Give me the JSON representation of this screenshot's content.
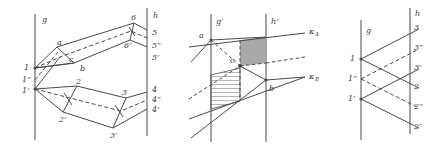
{
  "figure": {
    "kind": "geometric-line-diagram",
    "background_color": "#ffffff",
    "stroke_color": "#4a4a4a",
    "label_color": "#3a3a3a",
    "shade_fill": "#a8a8a8",
    "panel_count": 3
  },
  "panels": [
    {
      "id": "panel-left",
      "name": "left-panel",
      "axis_labels": {
        "left_line": "g",
        "right_line": "h"
      },
      "left_labels": [
        "1",
        "1”",
        "1’"
      ],
      "right_labels": [
        "5",
        "5”",
        "5’",
        "4",
        "4”",
        "4’"
      ],
      "interior_labels": [
        "a",
        "c",
        "b",
        "6",
        "6’",
        "2",
        "2’",
        "3",
        "3’"
      ]
    },
    {
      "id": "panel-middle",
      "name": "middle-panel",
      "axis_labels": {
        "left_line": "g’",
        "right_line": "h’"
      },
      "point_labels": [
        "a",
        "c",
        "b"
      ],
      "ray_labels": [
        "κ",
        "κ"
      ],
      "ray_sublabels": [
        "A",
        "B"
      ],
      "regions": [
        {
          "name": "shaded-quad",
          "style": "solid-gray"
        },
        {
          "name": "hatched-quad",
          "style": "diagonal-hatch"
        }
      ]
    },
    {
      "id": "panel-right",
      "name": "right-panel",
      "axis_labels": {
        "left_line": "g",
        "right_line": "h"
      },
      "left_labels": [
        "1",
        "1”",
        "1’"
      ],
      "right_labels": [
        "3",
        "3”",
        "3’",
        "2",
        "2”",
        "2’"
      ]
    }
  ]
}
